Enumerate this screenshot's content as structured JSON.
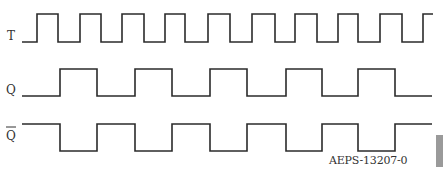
{
  "diagram": {
    "type": "timing-diagram",
    "signals": [
      {
        "name": "T",
        "label": "T",
        "high_y": 14,
        "low_y": 42,
        "start_x": 22,
        "end_x": 433,
        "initial": "low",
        "edges": [
          37,
          58,
          80,
          101,
          122,
          144,
          165,
          185,
          208,
          230,
          252,
          275,
          295,
          317,
          338,
          358,
          380,
          402,
          423
        ]
      },
      {
        "name": "Q",
        "label": "Q",
        "high_y": 69,
        "low_y": 96,
        "start_x": 22,
        "end_x": 432,
        "initial": "low",
        "edges": [
          60,
          97,
          135,
          172,
          210,
          247,
          286,
          322,
          358,
          395
        ]
      },
      {
        "name": "Q_bar",
        "label": "Q",
        "overbar": true,
        "high_y": 124,
        "low_y": 151,
        "start_x": 22,
        "end_x": 432,
        "initial": "high",
        "edges": [
          60,
          97,
          135,
          172,
          210,
          247,
          286,
          322,
          358,
          395
        ]
      }
    ],
    "figure_id": "AEPS-13207-0",
    "stroke_color": "#2b2b2b",
    "tab_color": "#9a9a9a"
  }
}
